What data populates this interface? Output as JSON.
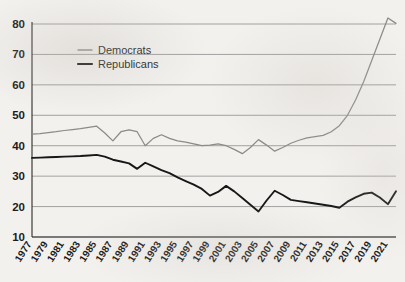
{
  "chart_data": {
    "type": "line",
    "title": "",
    "subtitle": "",
    "xlabel": "",
    "ylabel": "",
    "xlim": [
      1977,
      2022
    ],
    "ylim": [
      10,
      80
    ],
    "ytick_step": 10,
    "grid": true,
    "legend_position": "upper-left-inside",
    "x": [
      1977,
      1978,
      1979,
      1980,
      1981,
      1982,
      1983,
      1984,
      1985,
      1986,
      1987,
      1988,
      1989,
      1990,
      1991,
      1992,
      1993,
      1994,
      1995,
      1996,
      1997,
      1998,
      1999,
      2000,
      2001,
      2002,
      2003,
      2004,
      2005,
      2006,
      2007,
      2008,
      2009,
      2010,
      2011,
      2012,
      2013,
      2014,
      2015,
      2016,
      2017,
      2018,
      2019,
      2020,
      2021,
      2022
    ],
    "ytick_labels": [
      "10",
      "20",
      "30",
      "40",
      "50",
      "60",
      "70",
      "80"
    ],
    "xtick_labels": [
      "1977",
      "1979",
      "1981",
      "1983",
      "1985",
      "1987",
      "1989",
      "1991",
      "1993",
      "1995",
      "1997",
      "1999",
      "2001",
      "2003",
      "2005",
      "2007",
      "2009",
      "2011",
      "2013",
      "2015",
      "2017",
      "2019",
      "2021"
    ],
    "series": [
      {
        "name": "Democrats",
        "color": "#8a8a8a",
        "values": [
          43.8,
          44.0,
          44.3,
          44.6,
          45.0,
          45.3,
          45.6,
          46.0,
          46.4,
          44.2,
          41.6,
          44.6,
          45.2,
          44.6,
          40.0,
          42.4,
          43.6,
          42.4,
          41.6,
          41.2,
          40.6,
          40.0,
          40.2,
          40.6,
          40.0,
          38.8,
          37.4,
          39.4,
          42.0,
          40.2,
          38.2,
          39.4,
          40.8,
          41.8,
          42.6,
          43.0,
          43.4,
          44.6,
          46.6,
          50.0,
          55.0,
          61.0,
          68.0,
          75.0,
          82.0,
          80.2
        ]
      },
      {
        "name": "Republicans",
        "color": "#171717",
        "values": [
          36.0,
          36.1,
          36.2,
          36.3,
          36.4,
          36.5,
          36.6,
          36.8,
          37.0,
          36.4,
          35.4,
          34.8,
          34.2,
          32.4,
          34.4,
          33.2,
          32.0,
          31.0,
          29.6,
          28.4,
          27.2,
          25.8,
          23.6,
          24.8,
          26.8,
          25.0,
          22.8,
          20.6,
          18.4,
          22.0,
          25.2,
          23.8,
          22.2,
          21.8,
          21.4,
          21.0,
          20.6,
          20.2,
          19.6,
          21.6,
          23.0,
          24.2,
          24.6,
          23.0,
          20.8,
          25.0
        ]
      }
    ]
  },
  "legend": {
    "items": [
      {
        "label": "Democrats",
        "color": "#8a8a8a"
      },
      {
        "label": "Republicans",
        "color": "#171717"
      }
    ]
  }
}
